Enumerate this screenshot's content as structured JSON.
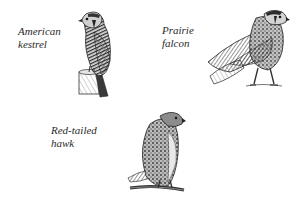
{
  "figure": {
    "background": "#ffffff",
    "ink_color": "#2a2a2a",
    "birds": [
      {
        "id": "american-kestrel",
        "label_lines": [
          "American",
          "kestrel"
        ],
        "perch": "post"
      },
      {
        "id": "prairie-falcon",
        "label_lines": [
          "Prairie",
          "falcon"
        ],
        "perch": "ground"
      },
      {
        "id": "red-tailed-hawk",
        "label_lines": [
          "Red-tailed",
          "hawk"
        ],
        "perch": "branch"
      }
    ]
  }
}
